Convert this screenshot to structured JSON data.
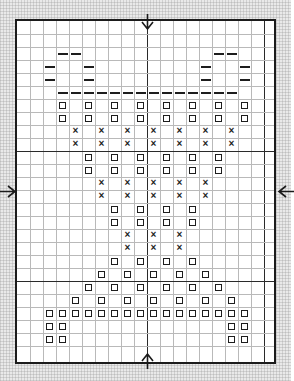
{
  "document": {
    "kind": "cross-stitch-pattern-chart",
    "title": "Cross Stitch Pattern Chart",
    "background_color": "#e9e9e9",
    "chart_background": "#ffffff",
    "border_color": "#1b1b1b",
    "grid_color": "#b9b9b9",
    "heavy_grid_color": "#2a2a2a",
    "symbol_color": "#1d1d1d"
  },
  "geometry": {
    "image_width": 291,
    "image_height": 381,
    "chart_left": 15,
    "chart_top": 19,
    "chart_width": 261,
    "chart_height": 345,
    "cell": 13.0,
    "cols": 20,
    "rows": 26,
    "heavy_cols": [
      10,
      19
    ],
    "heavy_rows": [
      10,
      20
    ]
  },
  "legend": {
    "symbols": [
      {
        "key": "dash",
        "name": "backstitch-dash",
        "glyph": "—"
      },
      {
        "key": "square",
        "name": "open-square",
        "glyph": "□"
      },
      {
        "key": "cross",
        "name": "cross-x",
        "glyph": "×"
      }
    ]
  },
  "arrows": [
    {
      "name": "center-arrow-top",
      "direction": "down",
      "glyph": "↓",
      "col": 10,
      "edge": "top"
    },
    {
      "name": "center-arrow-bottom",
      "direction": "up",
      "glyph": "↑",
      "col": 10,
      "edge": "bottom"
    },
    {
      "name": "center-arrow-left",
      "direction": "right",
      "glyph": "→",
      "row": 13,
      "edge": "left"
    },
    {
      "name": "center-arrow-right",
      "direction": "left",
      "glyph": "←",
      "row": 13,
      "edge": "right"
    }
  ],
  "chart_data": {
    "type": "heatmap",
    "xlabel": "",
    "ylabel": "",
    "grid": true,
    "legend_position": "none",
    "cols": 20,
    "rows": 26,
    "symbol_keys": [
      "dash",
      "square",
      "cross"
    ],
    "stitches": [
      {
        "sym": "dash",
        "r": 2,
        "c": [
          3,
          4,
          15,
          16
        ]
      },
      {
        "sym": "dash",
        "r": 3,
        "c": [
          2,
          5,
          14,
          17
        ]
      },
      {
        "sym": "dash",
        "r": 4,
        "c": [
          2,
          5,
          14,
          17
        ]
      },
      {
        "sym": "dash",
        "r": 5,
        "c": [
          3,
          4,
          5,
          6,
          7,
          8,
          9,
          10,
          11,
          12,
          13,
          14,
          15,
          16
        ]
      },
      {
        "sym": "square",
        "r": 6,
        "c": [
          3,
          5,
          7,
          9,
          11,
          13,
          15,
          17
        ]
      },
      {
        "sym": "square",
        "r": 7,
        "c": [
          3,
          5,
          7,
          9,
          11,
          13,
          15,
          17
        ]
      },
      {
        "sym": "cross",
        "r": 8,
        "c": [
          4,
          6,
          8,
          10,
          12,
          14,
          16
        ]
      },
      {
        "sym": "cross",
        "r": 9,
        "c": [
          4,
          6,
          8,
          10,
          12,
          14,
          16
        ]
      },
      {
        "sym": "square",
        "r": 10,
        "c": [
          5,
          7,
          9,
          11,
          13,
          15
        ]
      },
      {
        "sym": "square",
        "r": 11,
        "c": [
          5,
          7,
          9,
          11,
          13,
          15
        ]
      },
      {
        "sym": "cross",
        "r": 12,
        "c": [
          6,
          8,
          10,
          12,
          14
        ]
      },
      {
        "sym": "cross",
        "r": 13,
        "c": [
          6,
          8,
          10,
          12,
          14
        ]
      },
      {
        "sym": "square",
        "r": 14,
        "c": [
          7,
          9,
          11,
          13
        ]
      },
      {
        "sym": "square",
        "r": 15,
        "c": [
          7,
          9,
          11,
          13
        ]
      },
      {
        "sym": "cross",
        "r": 16,
        "c": [
          8,
          10,
          12
        ]
      },
      {
        "sym": "cross",
        "r": 17,
        "c": [
          8,
          10,
          12
        ]
      },
      {
        "sym": "square",
        "r": 18,
        "c": [
          7,
          9,
          11,
          13
        ]
      },
      {
        "sym": "square",
        "r": 19,
        "c": [
          6,
          8,
          10,
          12,
          14
        ]
      },
      {
        "sym": "square",
        "r": 20,
        "c": [
          5,
          7,
          9,
          11,
          13,
          15
        ]
      },
      {
        "sym": "square",
        "r": 21,
        "c": [
          4,
          6,
          8,
          10,
          12,
          14,
          16
        ]
      },
      {
        "sym": "square",
        "r": 22,
        "c": [
          2,
          3,
          4,
          5,
          6,
          7,
          8,
          9,
          10,
          11,
          12,
          13,
          14,
          15,
          16,
          17
        ]
      },
      {
        "sym": "square",
        "r": 23,
        "c": [
          2,
          3,
          16,
          17
        ]
      },
      {
        "sym": "square",
        "r": 24,
        "c": [
          2,
          3,
          16,
          17
        ]
      }
    ]
  }
}
